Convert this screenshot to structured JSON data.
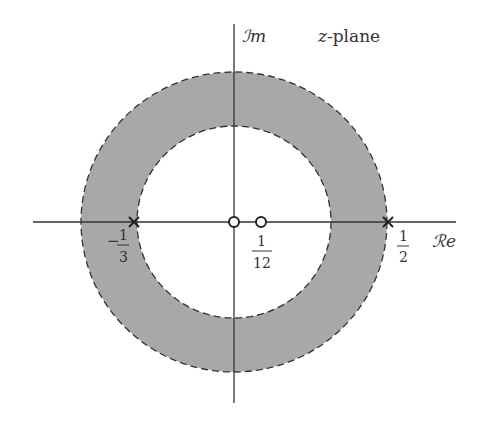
{
  "figure": {
    "plane_label": "z-plane",
    "imag_axis_label": "ℐm",
    "real_axis_label": "ℛe",
    "colors": {
      "region_fill": "#a8a8a8",
      "axis": "#333333",
      "background": "#ffffff"
    },
    "region_of_convergence": {
      "description": "annulus 1/3 < |z| < 1/2",
      "inner_radius": "1/3",
      "outer_radius": "1/2"
    },
    "poles": [
      {
        "label_num": "1",
        "label_den": "3",
        "sign": "−",
        "value": "-1/3"
      },
      {
        "label_num": "1",
        "label_den": "2",
        "sign": "",
        "value": "1/2"
      }
    ],
    "zeros": [
      {
        "value": "0"
      },
      {
        "label_num": "1",
        "label_den": "12",
        "value": "1/12"
      }
    ]
  }
}
